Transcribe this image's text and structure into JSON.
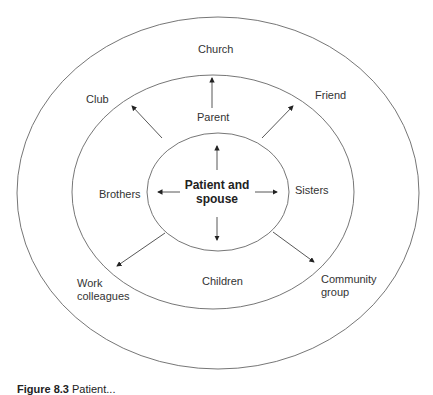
{
  "diagram": {
    "type": "concentric-ellipses",
    "rings": [
      {
        "name": "inner",
        "label": "Patient and spouse"
      },
      {
        "name": "middle",
        "labels": [
          "Parent",
          "Brothers",
          "Sisters",
          "Children"
        ]
      },
      {
        "name": "outer",
        "labels": [
          "Church",
          "Club",
          "Friend",
          "Work colleagues",
          "Community group"
        ]
      }
    ],
    "center": {
      "line1": "Patient and",
      "line2": "spouse"
    },
    "middle_ring": {
      "parent": "Parent",
      "brothers": "Brothers",
      "sisters": "Sisters",
      "children": "Children"
    },
    "outer_ring": {
      "church": "Church",
      "club": "Club",
      "friend": "Friend",
      "work_line1": "Work",
      "work_line2": "colleagues",
      "community_line1": "Community",
      "community_line2": "group"
    },
    "arrows": [
      "up",
      "down",
      "left",
      "right",
      "up-left",
      "up-right",
      "down-left",
      "down-right"
    ],
    "colors": {
      "stroke": "#555555",
      "text": "#333333",
      "background": "#ffffff"
    }
  },
  "caption": {
    "figure": "Figure 8.3",
    "text": "Patient..."
  }
}
